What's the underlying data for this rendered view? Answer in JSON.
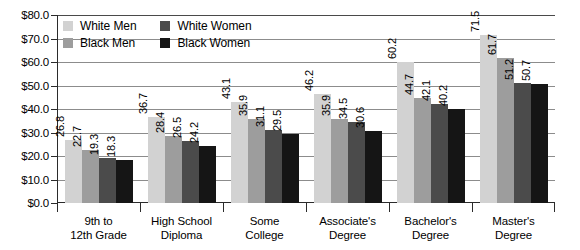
{
  "chart_data": {
    "type": "bar",
    "title": "",
    "subtitle": "",
    "xlabel": "",
    "ylabel": "",
    "grid": true,
    "legend_position": "top-left-inside",
    "orientation": "vertical",
    "value_labels": true,
    "value_label_rotation": "vertical",
    "ylim": [
      0,
      80
    ],
    "ytick_step": 10,
    "ytick_labels": [
      "$0.0",
      "$10.0",
      "$20.0",
      "$30.0",
      "$40.0",
      "$50.0",
      "$60.0",
      "$70.0",
      "$80.0"
    ],
    "ytick_values": [
      0,
      10,
      20,
      30,
      40,
      50,
      60,
      70,
      80
    ],
    "categories": [
      "9th to\n12th Grade",
      "High School\nDiploma",
      "Some\nCollege",
      "Associate's\nDegree",
      "Bachelor's\nDegree",
      "Master's\nDegree"
    ],
    "category_lines": [
      [
        "9th to",
        "12th Grade"
      ],
      [
        "High School",
        "Diploma"
      ],
      [
        "Some",
        "College"
      ],
      [
        "Associate's",
        "Degree"
      ],
      [
        "Bachelor's",
        "Degree"
      ],
      [
        "Master's",
        "Degree"
      ]
    ],
    "series": [
      {
        "name": "White Men",
        "color": "#d2d2d2",
        "values": [
          26.8,
          36.7,
          43.1,
          46.2,
          60.2,
          71.5
        ]
      },
      {
        "name": "Black Men",
        "color": "#9d9d9d",
        "values": [
          22.7,
          28.4,
          35.9,
          35.9,
          44.7,
          61.7
        ]
      },
      {
        "name": "White Women",
        "color": "#4b4b4b",
        "values": [
          19.3,
          26.5,
          31.1,
          34.5,
          42.1,
          51.2
        ]
      },
      {
        "name": "Black Women",
        "color": "#151515",
        "values": [
          18.3,
          24.2,
          29.5,
          30.6,
          40.2,
          50.7
        ]
      }
    ],
    "legend_order": [
      "White Men",
      "White Women",
      "Black Men",
      "Black Women"
    ]
  },
  "colors": {
    "white_men": "#d2d2d2",
    "black_men": "#9d9d9d",
    "white_women": "#4b4b4b",
    "black_women": "#151515",
    "axis": "#2b2b2b",
    "gridline": "#8c8c8c",
    "background": "#ffffff",
    "text": "#000000"
  }
}
